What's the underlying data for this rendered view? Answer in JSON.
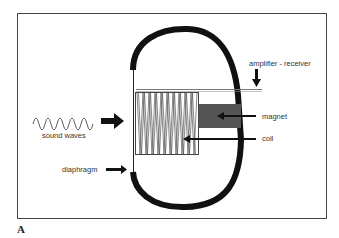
{
  "figure": {
    "panel_label": "A",
    "labels": {
      "sound_waves": "sound waves",
      "diaphragm": "diaphragm",
      "amplifier_receiver": "amplifier - receiver",
      "magnet": "magnet",
      "coil": "coil"
    },
    "colors": {
      "frame": "#444444",
      "housing": "#111111",
      "magnet": "#555555",
      "coil": "#444444",
      "text": "#333333"
    }
  }
}
